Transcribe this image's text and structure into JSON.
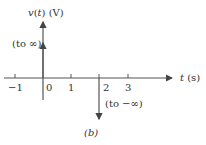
{
  "diagram": {
    "y_axis_label": {
      "var": "v",
      "arg": "t",
      "unit": "(V)"
    },
    "x_axis_label": {
      "var": "t",
      "unit": "(s)"
    },
    "ticks": [
      {
        "label": "−1",
        "t": -1
      },
      {
        "label": "0",
        "t": 0
      },
      {
        "label": "1",
        "t": 1
      },
      {
        "label": "2",
        "t": 2
      },
      {
        "label": "3",
        "t": 3
      }
    ],
    "impulses": [
      {
        "t": 0,
        "direction": "up",
        "label": "(to ∞)"
      },
      {
        "t": 2,
        "direction": "down",
        "label": "(to −∞)"
      }
    ],
    "caption": "(b)",
    "colors": {
      "line": "#555555",
      "text": "#333333"
    }
  }
}
